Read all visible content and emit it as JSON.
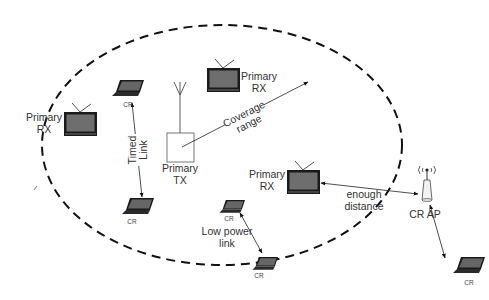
{
  "diagram": {
    "coverage": {
      "label_line1": "Coverage",
      "label_line2": "range"
    },
    "primary_tx": {
      "label_line1": "Primary",
      "label_line2": "TX"
    },
    "primary_rx": [
      {
        "label_line1": "Primary",
        "label_line2": "RX"
      },
      {
        "label_line1": "Primary",
        "label_line2": "RX"
      },
      {
        "label_line1": "Primary",
        "label_line2": "RX"
      }
    ],
    "cr_devices": [
      {
        "label": "CR"
      },
      {
        "label": "CR"
      },
      {
        "label": "CR"
      },
      {
        "label": "CR"
      },
      {
        "label": "CR"
      }
    ],
    "cr_ap": {
      "label": "CR AP"
    },
    "links": {
      "timed_line1": "Timed",
      "timed_line2": "Link",
      "low_power_line1": "Low power",
      "low_power_line2": "link",
      "distance_line1": "enough",
      "distance_line2": "distance"
    },
    "colors": {
      "stroke": "#111111",
      "screen": "#6b6b6b",
      "text": "#333333"
    }
  }
}
